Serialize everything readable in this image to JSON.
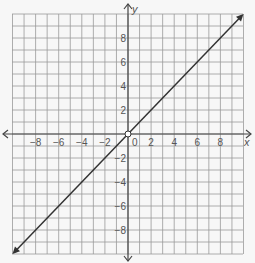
{
  "chart_data": {
    "type": "line",
    "title": "",
    "xlabel": "x",
    "ylabel": "y",
    "xlim": [
      -10,
      10
    ],
    "ylim": [
      -10,
      10
    ],
    "grid": true,
    "x_ticks": [
      "-8",
      "-6",
      "-4",
      "-2",
      "2",
      "4",
      "6",
      "8"
    ],
    "y_ticks": [
      "8",
      "6",
      "4",
      "2",
      "-2",
      "-4",
      "-6",
      "-8"
    ],
    "origin_label": "0",
    "series": [
      {
        "name": "y = x",
        "x": [
          -10,
          10
        ],
        "y": [
          -10,
          10
        ],
        "arrows_both_ends": true
      }
    ],
    "annotations": [
      {
        "type": "open-circle",
        "x": 0,
        "y": 0
      }
    ],
    "colors": {
      "grid": "#999999",
      "axis": "#444444",
      "line": "#333333",
      "background": "#f7f7f7"
    }
  }
}
